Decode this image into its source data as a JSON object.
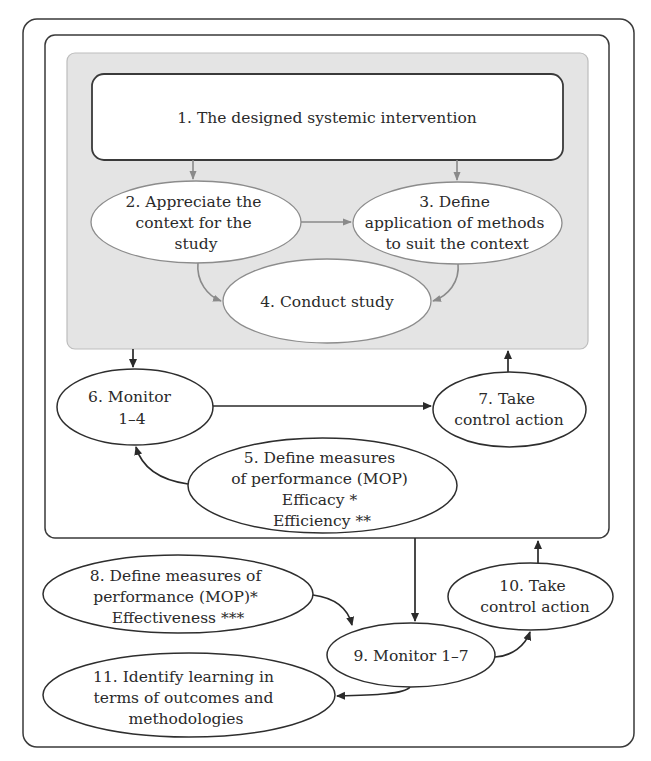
{
  "diagram": {
    "nodes": {
      "n1": {
        "lines": [
          "1. The designed systemic intervention"
        ]
      },
      "n2": {
        "lines": [
          "2. Appreciate the",
          "context for the",
          "study"
        ]
      },
      "n3": {
        "lines": [
          "3. Define",
          "application of methods",
          "to suit the context"
        ]
      },
      "n4": {
        "lines": [
          "4. Conduct study"
        ]
      },
      "n5": {
        "lines": [
          "5. Define measures",
          "of performance (MOP)",
          "Efficacy *",
          "Efficiency **"
        ]
      },
      "n6": {
        "lines": [
          "6. Monitor",
          "1–4"
        ]
      },
      "n7": {
        "lines": [
          "7. Take",
          "control action"
        ]
      },
      "n8": {
        "lines": [
          "8. Define measures of",
          "performance (MOP)*",
          "Effectiveness ***"
        ]
      },
      "n9": {
        "lines": [
          "9. Monitor 1–7"
        ]
      },
      "n10": {
        "lines": [
          "10. Take",
          "control action"
        ]
      },
      "n11": {
        "lines": [
          "11. Identify learning in",
          "terms of outcomes and",
          "methodologies"
        ]
      }
    },
    "edges": [
      {
        "from": "n1",
        "to": "n2"
      },
      {
        "from": "n1",
        "to": "n3"
      },
      {
        "from": "n2",
        "to": "n3"
      },
      {
        "from": "n2",
        "to": "n4"
      },
      {
        "from": "n3",
        "to": "n4"
      },
      {
        "from": "inner-panel",
        "to": "n6"
      },
      {
        "from": "n6",
        "to": "n7"
      },
      {
        "from": "n7",
        "to": "inner-panel"
      },
      {
        "from": "n5",
        "to": "n6"
      },
      {
        "from": "middle-frame",
        "to": "n9"
      },
      {
        "from": "n8",
        "to": "n9"
      },
      {
        "from": "n9",
        "to": "n10"
      },
      {
        "from": "n10",
        "to": "middle-frame"
      },
      {
        "from": "n9",
        "to": "n11"
      }
    ],
    "colors": {
      "panel_fill": "#e4e4e4",
      "line_dark": "#2a2a2a",
      "line_gray": "#8a8a8a"
    }
  }
}
